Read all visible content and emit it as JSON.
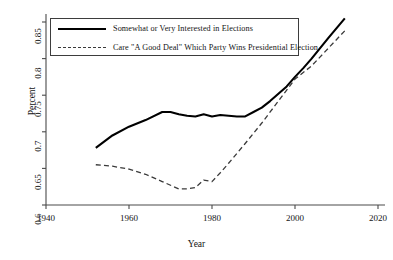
{
  "chart_data": {
    "type": "line",
    "title": "",
    "xlabel": "Year",
    "ylabel": "Percent",
    "xlim": [
      1940,
      2020
    ],
    "ylim": [
      0.6,
      0.85
    ],
    "xticks": [
      1940,
      1960,
      1980,
      2000,
      2020
    ],
    "xtick_labels": [
      "1940",
      "1960",
      "1980",
      "2000",
      "2020"
    ],
    "yticks": [
      0.6,
      0.65,
      0.7,
      0.75,
      0.8,
      0.85
    ],
    "ytick_labels": [
      "0.6",
      "0.65",
      "0.7",
      "0.75",
      "0.8",
      "0.85"
    ],
    "grid": false,
    "legend_position": "upper left",
    "series": [
      {
        "name": "Somewhat or Very Interested in Elections",
        "style": "solid",
        "color": "#000000",
        "x": [
          1952,
          1956,
          1960,
          1964,
          1968,
          1970,
          1972,
          1974,
          1976,
          1978,
          1980,
          1982,
          1984,
          1986,
          1988,
          1990,
          1992,
          1994,
          1996,
          1998,
          2000,
          2002,
          2004,
          2008,
          2012
        ],
        "y": [
          0.678,
          0.695,
          0.707,
          0.716,
          0.727,
          0.727,
          0.724,
          0.722,
          0.721,
          0.724,
          0.721,
          0.723,
          0.722,
          0.721,
          0.721,
          0.727,
          0.733,
          0.742,
          0.752,
          0.762,
          0.775,
          0.787,
          0.8,
          0.828,
          0.855
        ]
      },
      {
        "name": "Care \"A Good Deal\" Which Party Wins Presidential Election",
        "style": "dashed",
        "color": "#3a3a3a",
        "x": [
          1952,
          1956,
          1960,
          1964,
          1968,
          1972,
          1974,
          1976,
          1978,
          1980,
          1982,
          1984,
          1988,
          1992,
          1996,
          2000,
          2004,
          2008,
          2012
        ],
        "y": [
          0.655,
          0.653,
          0.649,
          0.642,
          0.632,
          0.622,
          0.622,
          0.624,
          0.634,
          0.632,
          0.644,
          0.657,
          0.684,
          0.712,
          0.742,
          0.772,
          0.79,
          0.814,
          0.838
        ]
      }
    ]
  },
  "axes": {
    "xlabel": "Year",
    "ylabel": "Percent"
  },
  "legend": {
    "entries": [
      {
        "label": "Somewhat or Very Interested in Elections",
        "style": "solid"
      },
      {
        "label": "Care \"A Good Deal\" Which Party Wins Presidential Election",
        "style": "dashed"
      }
    ]
  }
}
